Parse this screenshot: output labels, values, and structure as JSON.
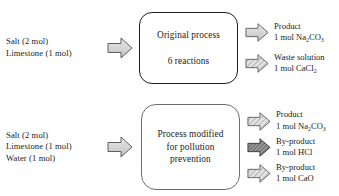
{
  "diagram": {
    "type": "process-flow-block-diagram",
    "colors": {
      "text": "#1a1a1a",
      "arrow_fill_light": "#d8d8d8",
      "arrow_fill_dark": "#8f8f8f",
      "arrow_stroke": "#5a5a5a",
      "box_border_original": "#1c1c1c",
      "box_border_modified": "#6d6d6d",
      "background": "#ffffff"
    },
    "rows": [
      {
        "id": "original",
        "inputs": [
          "Salt (2 mol)",
          "Limestone (1 mol)"
        ],
        "input_arrow_icon": "right-arrow-icon",
        "process": {
          "line1": "Original process",
          "line2": "6 reactions"
        },
        "outputs": [
          {
            "arrow_icon": "right-arrow-icon",
            "arrow_style": "plain",
            "label": "Product",
            "amount_prefix": "1 mol Na",
            "amount_sub1": "2",
            "amount_mid": "CO",
            "amount_sub2": "3",
            "amount_suffix": "",
            "amount_plain": "1 mol Na2CO3"
          },
          {
            "arrow_icon": "right-arrow-icon",
            "arrow_style": "hatched",
            "label": "Waste solution",
            "amount_prefix": "1 mol CaCl",
            "amount_sub1": "2",
            "amount_mid": "",
            "amount_sub2": "",
            "amount_suffix": "",
            "amount_plain": "1 mol CaCl2"
          }
        ]
      },
      {
        "id": "modified",
        "inputs": [
          "Salt (2 mol)",
          "Limestone (1 mol)",
          "Water (1 mol)"
        ],
        "input_arrow_icon": "right-arrow-icon",
        "process": {
          "line1": "Process modified",
          "line2": "for pollution",
          "line3": "prevention"
        },
        "outputs": [
          {
            "arrow_icon": "right-arrow-icon",
            "arrow_style": "plain",
            "label": "Product",
            "amount_prefix": "1 mol Na",
            "amount_sub1": "2",
            "amount_mid": "CO",
            "amount_sub2": "3",
            "amount_suffix": "",
            "amount_plain": "1 mol Na2CO3"
          },
          {
            "arrow_icon": "right-arrow-icon",
            "arrow_style": "dense-hatched",
            "label": "By-product",
            "amount_prefix": "1 mol HCl",
            "amount_sub1": "",
            "amount_mid": "",
            "amount_sub2": "",
            "amount_suffix": "",
            "amount_plain": "1 mol HCl"
          },
          {
            "arrow_icon": "right-arrow-icon",
            "arrow_style": "hatched",
            "label": "By-product",
            "amount_prefix": "1 mol CaO",
            "amount_sub1": "",
            "amount_mid": "",
            "amount_sub2": "",
            "amount_suffix": "",
            "amount_plain": "1 mol CaO"
          }
        ]
      }
    ]
  }
}
